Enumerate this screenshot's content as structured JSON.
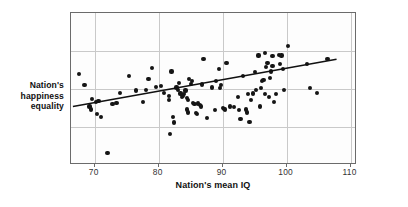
{
  "chart_data": {
    "type": "scatter",
    "title": "",
    "xlabel": "Nation's mean IQ",
    "ylabel": "Nation's happiness equality",
    "xlim": [
      66.3,
      111.0
    ],
    "ylim": [
      0,
      100
    ],
    "xticks": [
      70,
      80,
      90,
      100,
      110
    ],
    "xticklabels": [
      "70",
      "80",
      "90",
      "100",
      "110"
    ],
    "yticks": [],
    "yticklabels": [],
    "grid": "both-axes-light-gray",
    "legend": "none",
    "annotation": "DATA FROM NIKOLAEV & SALAHODJAEV (2016).",
    "marker": {
      "shape": "circle",
      "color": "#151515",
      "size_px": 4.2
    },
    "trendline": {
      "type": "linear-fit",
      "color": "#111111",
      "x_start": 66.6,
      "y_start": 38.5,
      "x_end": 107.8,
      "y_end": 69.5
    },
    "points": [
      {
        "x": 67.6,
        "y": 60.0
      },
      {
        "x": 68.4,
        "y": 52.5
      },
      {
        "x": 69.6,
        "y": 43.5
      },
      {
        "x": 69.2,
        "y": 38.5
      },
      {
        "x": 69.4,
        "y": 36.5
      },
      {
        "x": 70.2,
        "y": 41.5
      },
      {
        "x": 70.6,
        "y": 42.0
      },
      {
        "x": 70.4,
        "y": 33.5
      },
      {
        "x": 71.0,
        "y": 31.5
      },
      {
        "x": 72.0,
        "y": 8.0
      },
      {
        "x": 72.8,
        "y": 40.0
      },
      {
        "x": 73.4,
        "y": 41.0
      },
      {
        "x": 74.0,
        "y": 47.5
      },
      {
        "x": 75.4,
        "y": 58.5
      },
      {
        "x": 76.4,
        "y": 49.0
      },
      {
        "x": 77.6,
        "y": 41.5
      },
      {
        "x": 78.4,
        "y": 56.5
      },
      {
        "x": 78.0,
        "y": 49.5
      },
      {
        "x": 79.0,
        "y": 64.0
      },
      {
        "x": 79.6,
        "y": 51.5
      },
      {
        "x": 80.4,
        "y": 52.0
      },
      {
        "x": 80.8,
        "y": 47.5
      },
      {
        "x": 81.6,
        "y": 45.5
      },
      {
        "x": 81.6,
        "y": 42.5
      },
      {
        "x": 81.8,
        "y": 20.5
      },
      {
        "x": 82.0,
        "y": 61.5
      },
      {
        "x": 82.2,
        "y": 31.5
      },
      {
        "x": 82.4,
        "y": 28.0
      },
      {
        "x": 82.8,
        "y": 51.0
      },
      {
        "x": 83.0,
        "y": 49.5
      },
      {
        "x": 83.2,
        "y": 54.0
      },
      {
        "x": 83.4,
        "y": 47.0
      },
      {
        "x": 83.6,
        "y": 45.0
      },
      {
        "x": 83.8,
        "y": 45.5
      },
      {
        "x": 84.0,
        "y": 46.5
      },
      {
        "x": 84.2,
        "y": 49.0
      },
      {
        "x": 84.4,
        "y": 44.0
      },
      {
        "x": 84.6,
        "y": 43.0
      },
      {
        "x": 84.8,
        "y": 56.5
      },
      {
        "x": 84.4,
        "y": 36.5
      },
      {
        "x": 84.6,
        "y": 34.5
      },
      {
        "x": 85.0,
        "y": 53.5
      },
      {
        "x": 85.2,
        "y": 55.0
      },
      {
        "x": 85.4,
        "y": 41.0
      },
      {
        "x": 85.6,
        "y": 40.0
      },
      {
        "x": 85.8,
        "y": 34.0
      },
      {
        "x": 86.0,
        "y": 33.5
      },
      {
        "x": 86.2,
        "y": 40.5
      },
      {
        "x": 86.4,
        "y": 39.5
      },
      {
        "x": 86.6,
        "y": 38.5
      },
      {
        "x": 86.8,
        "y": 53.0
      },
      {
        "x": 87.0,
        "y": 70.0
      },
      {
        "x": 87.6,
        "y": 31.0
      },
      {
        "x": 88.4,
        "y": 51.0
      },
      {
        "x": 88.8,
        "y": 36.0
      },
      {
        "x": 89.0,
        "y": 55.5
      },
      {
        "x": 89.4,
        "y": 63.0
      },
      {
        "x": 89.6,
        "y": 50.5
      },
      {
        "x": 89.8,
        "y": 52.5
      },
      {
        "x": 90.0,
        "y": 37.5
      },
      {
        "x": 90.2,
        "y": 37.0
      },
      {
        "x": 90.4,
        "y": 36.5
      },
      {
        "x": 90.6,
        "y": 67.0
      },
      {
        "x": 91.2,
        "y": 38.5
      },
      {
        "x": 91.8,
        "y": 38.0
      },
      {
        "x": 92.4,
        "y": 44.5
      },
      {
        "x": 92.6,
        "y": 36.0
      },
      {
        "x": 92.8,
        "y": 30.5
      },
      {
        "x": 93.2,
        "y": 58.5
      },
      {
        "x": 93.6,
        "y": 36.5
      },
      {
        "x": 93.8,
        "y": 34.5
      },
      {
        "x": 94.0,
        "y": 46.5
      },
      {
        "x": 94.2,
        "y": 28.5
      },
      {
        "x": 94.4,
        "y": 43.0
      },
      {
        "x": 94.8,
        "y": 47.0
      },
      {
        "x": 95.0,
        "y": 61.0
      },
      {
        "x": 95.2,
        "y": 49.5
      },
      {
        "x": 95.6,
        "y": 72.0
      },
      {
        "x": 95.8,
        "y": 38.5
      },
      {
        "x": 96.0,
        "y": 50.5
      },
      {
        "x": 96.2,
        "y": 55.0
      },
      {
        "x": 96.4,
        "y": 56.0
      },
      {
        "x": 96.6,
        "y": 73.5
      },
      {
        "x": 96.6,
        "y": 46.5
      },
      {
        "x": 96.8,
        "y": 64.5
      },
      {
        "x": 97.0,
        "y": 67.0
      },
      {
        "x": 97.2,
        "y": 44.5
      },
      {
        "x": 97.4,
        "y": 57.5
      },
      {
        "x": 97.6,
        "y": 61.5
      },
      {
        "x": 97.8,
        "y": 71.5
      },
      {
        "x": 97.8,
        "y": 65.0
      },
      {
        "x": 98.0,
        "y": 41.5
      },
      {
        "x": 98.4,
        "y": 46.5
      },
      {
        "x": 98.8,
        "y": 72.5
      },
      {
        "x": 99.0,
        "y": 66.5
      },
      {
        "x": 99.2,
        "y": 72.0
      },
      {
        "x": 99.4,
        "y": 63.0
      },
      {
        "x": 99.6,
        "y": 49.5
      },
      {
        "x": 100.2,
        "y": 78.5
      },
      {
        "x": 103.2,
        "y": 66.5
      },
      {
        "x": 103.6,
        "y": 50.5
      },
      {
        "x": 104.8,
        "y": 47.5
      },
      {
        "x": 106.4,
        "y": 70.0
      }
    ]
  },
  "figure": {
    "ylabel_lines": [
      "Nation's",
      "happiness",
      "equality"
    ],
    "xlabel": "Nation's mean IQ",
    "credit": "DATA FROM NIKOLAEV & SALAHODJAEV (2016)."
  }
}
